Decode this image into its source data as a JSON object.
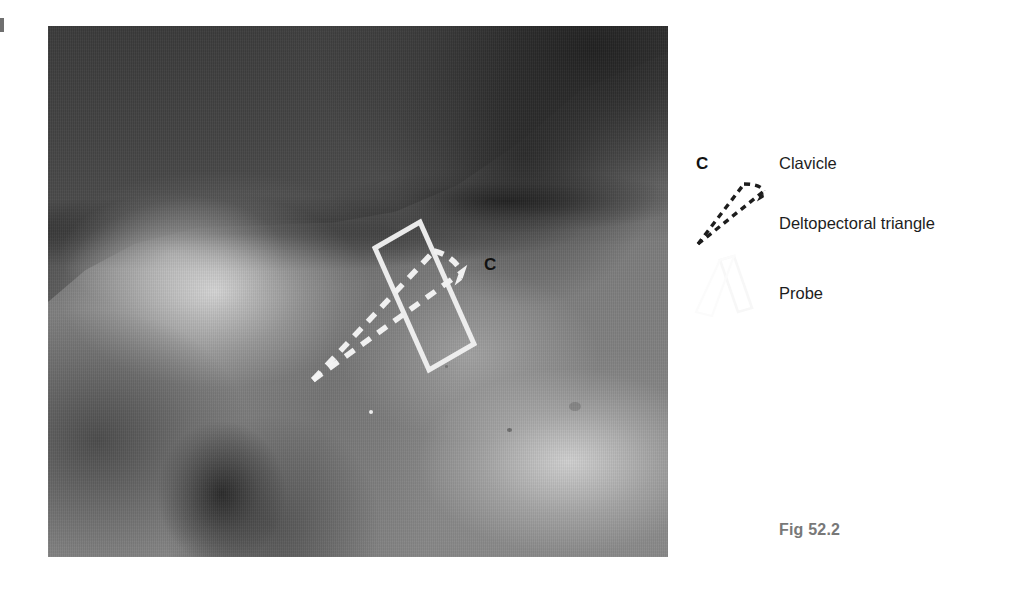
{
  "figure": {
    "caption": "Fig 52.2",
    "caption_color": "#787878"
  },
  "photograph": {
    "description": "Grayscale clinical photograph of a right shoulder and upper chest, showing the deltopectoral region with an ultrasound probe position and the deltopectoral triangle outlined",
    "overlay_labels": [
      {
        "name": "clavicle-marker",
        "text": "C",
        "color": "#121212"
      }
    ],
    "overlays": [
      {
        "name": "probe-outline",
        "style": "solid",
        "color": "#f2f2f2",
        "shape": "rectangle"
      },
      {
        "name": "deltopectoral-triangle-outline",
        "style": "dashed",
        "color": "#f2f2f2",
        "shape": "elongated-triangle"
      }
    ]
  },
  "legend": {
    "items": [
      {
        "symbol": "bold-letter",
        "symbol_text": "C",
        "label": "Clavicle",
        "symbol_color": "#121212"
      },
      {
        "symbol": "dashed-triangle",
        "symbol_text": "",
        "label": "Deltopectoral triangle",
        "symbol_color": "#1d1d1d"
      },
      {
        "symbol": "solid-rectangle-outline",
        "symbol_text": "",
        "label": "Probe",
        "symbol_color": "#fafafa"
      }
    ]
  }
}
